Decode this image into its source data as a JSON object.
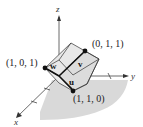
{
  "diagram": {
    "type": "3d-parallelepiped",
    "axes": {
      "x_label": "x",
      "y_label": "y",
      "z_label": "z"
    },
    "points": [
      {
        "label": "(1, 0, 1)",
        "name": "point-1-0-1"
      },
      {
        "label": "(0, 1, 1)",
        "name": "point-0-1-1"
      },
      {
        "label": "(1, 1, 0)",
        "name": "point-1-1-0"
      }
    ],
    "vectors": [
      {
        "label": "u",
        "to": "(1, 1, 0)"
      },
      {
        "label": "v",
        "to": "(0, 1, 1)"
      },
      {
        "label": "w",
        "to": "(1, 0, 1)"
      }
    ],
    "colors": {
      "shadow": "#d9d9d9",
      "box_face": "#e6e6e6",
      "edges": "#333333",
      "vectors": "#111111",
      "axes": "#444444"
    }
  }
}
